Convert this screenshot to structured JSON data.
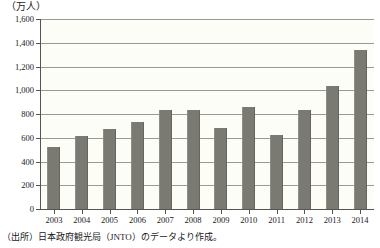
{
  "unit_label": "（万人）",
  "source_note": "（出所）日本政府観光局（JNTO）のデータより作成。",
  "colors": {
    "bar": "#7a7a72",
    "gridline": "#9a9a92",
    "axis": "#555550",
    "plot_background": "#fdfdf8"
  },
  "chart_data": {
    "type": "bar",
    "title": "",
    "subtitle": "",
    "xlabel": "",
    "ylabel": "（万人）",
    "categories": [
      "2003",
      "2004",
      "2005",
      "2006",
      "2007",
      "2008",
      "2009",
      "2010",
      "2011",
      "2012",
      "2013",
      "2014"
    ],
    "values": [
      521,
      614,
      673,
      733,
      835,
      835,
      679,
      861,
      622,
      836,
      1036,
      1341
    ],
    "series": [
      {
        "name": "訪日外国人旅行者数",
        "values": [
          521,
          614,
          673,
          733,
          835,
          835,
          679,
          861,
          622,
          836,
          1036,
          1341
        ]
      }
    ],
    "ylim": [
      0,
      1600
    ],
    "yticks": [
      0,
      200,
      400,
      600,
      800,
      1000,
      1200,
      1400,
      1600
    ],
    "ytick_labels": [
      "0",
      "200",
      "400",
      "600",
      "800",
      "1,000",
      "1,200",
      "1,400",
      "1,600"
    ],
    "grid": true,
    "legend": "none"
  }
}
